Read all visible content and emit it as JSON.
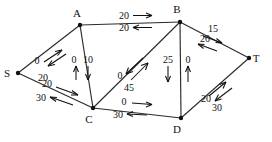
{
  "diagram": {
    "type": "flow-network",
    "nodes": [
      {
        "id": "S",
        "label": "S",
        "x": 18,
        "y": 73,
        "label_dx": -11,
        "label_dy": 4
      },
      {
        "id": "A",
        "label": "A",
        "x": 80,
        "y": 25,
        "label_dx": -3,
        "label_dy": -8
      },
      {
        "id": "B",
        "label": "B",
        "x": 180,
        "y": 22,
        "label_dx": -3,
        "label_dy": -9
      },
      {
        "id": "C",
        "label": "C",
        "x": 93,
        "y": 108,
        "label_dx": -4,
        "label_dy": 15
      },
      {
        "id": "D",
        "label": "D",
        "x": 181,
        "y": 118,
        "label_dx": -4,
        "label_dy": 15
      },
      {
        "id": "T",
        "label": "T",
        "x": 249,
        "y": 58,
        "label_dx": 7,
        "label_dy": 4
      }
    ],
    "edges": [
      {
        "from": "S",
        "to": "A",
        "flows": [
          {
            "value": "0",
            "direction": "forward",
            "label_x": 37,
            "label_y": 64
          },
          {
            "value": "20",
            "direction": "backward",
            "label_x": 42,
            "label_y": 80
          }
        ]
      },
      {
        "from": "S",
        "to": "C",
        "flows": [
          {
            "value": "20",
            "direction": "forward",
            "label_x": 45,
            "label_y": 88
          },
          {
            "value": "30",
            "direction": "backward",
            "label_x": 41,
            "label_y": 100
          }
        ]
      },
      {
        "from": "A",
        "to": "B",
        "flows": [
          {
            "value": "20",
            "direction": "forward",
            "label_x": 123,
            "label_y": 18
          },
          {
            "value": "20",
            "direction": "backward",
            "label_x": 123,
            "label_y": 30
          }
        ]
      },
      {
        "from": "A",
        "to": "C",
        "flows": [
          {
            "value": "0",
            "direction": "backward",
            "label_x": 74,
            "label_y": 62
          },
          {
            "value": "10",
            "direction": "forward",
            "label_x": 88,
            "label_y": 62
          }
        ]
      },
      {
        "from": "C",
        "to": "B",
        "flows": [
          {
            "value": "0",
            "direction": "backward",
            "label_x": 120,
            "label_y": 78
          },
          {
            "value": "45",
            "direction": "forward",
            "label_x": 128,
            "label_y": 90
          }
        ]
      },
      {
        "from": "B",
        "to": "D",
        "flows": [
          {
            "value": "25",
            "direction": "forward",
            "label_x": 166,
            "label_y": 62
          },
          {
            "value": "0",
            "direction": "backward",
            "label_x": 186,
            "label_y": 62
          }
        ]
      },
      {
        "from": "C",
        "to": "D",
        "flows": [
          {
            "value": "0",
            "direction": "forward",
            "label_x": 123,
            "label_y": 104
          },
          {
            "value": "30",
            "direction": "backward",
            "label_x": 117,
            "label_y": 117
          }
        ]
      },
      {
        "from": "B",
        "to": "T",
        "flows": [
          {
            "value": "15",
            "direction": "forward",
            "label_x": 213,
            "label_y": 31
          },
          {
            "value": "20",
            "direction": "backward",
            "label_x": 205,
            "label_y": 41
          }
        ]
      },
      {
        "from": "D",
        "to": "T",
        "flows": [
          {
            "value": "20",
            "direction": "forward",
            "label_x": 206,
            "label_y": 101
          },
          {
            "value": "30",
            "direction": "backward",
            "label_x": 216,
            "label_y": 110
          }
        ]
      }
    ],
    "colors": {
      "line": "#2b2b2b",
      "text": "#111111",
      "background": "#ffffff"
    }
  }
}
